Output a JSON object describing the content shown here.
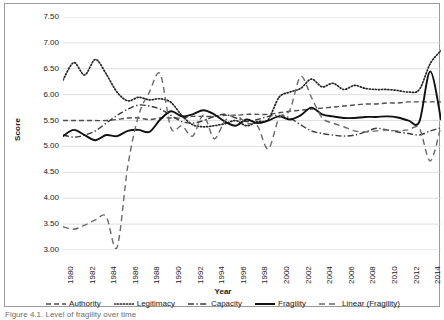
{
  "figure": {
    "caption": "Figure 4.1. Level of fragility over time"
  },
  "chart_data": {
    "type": "line",
    "title": "",
    "xlabel": "Year",
    "ylabel": "Score",
    "xlim": [
      1980,
      2015
    ],
    "ylim": [
      3.0,
      7.5
    ],
    "ytick_step": 0.5,
    "grid": true,
    "grid_axis": "y",
    "legend_position": "bottom",
    "x_tick_labels": [
      "1980",
      "1982",
      "1984",
      "1986",
      "1988",
      "1990",
      "1992",
      "1994",
      "1996",
      "1998",
      "2000",
      "2002",
      "2004",
      "2006",
      "2008",
      "2010",
      "2012",
      "2014"
    ],
    "y_tick_labels": [
      "7.50",
      "7.00",
      "6.50",
      "6.00",
      "5.50",
      "5.00",
      "4.50",
      "4.00",
      "3.50",
      "3.00"
    ],
    "x": [
      1980,
      1981,
      1982,
      1983,
      1984,
      1985,
      1986,
      1987,
      1988,
      1989,
      1990,
      1991,
      1992,
      1993,
      1994,
      1995,
      1996,
      1997,
      1998,
      1999,
      2000,
      2001,
      2002,
      2003,
      2004,
      2005,
      2006,
      2007,
      2008,
      2009,
      2010,
      2011,
      2012,
      2013,
      2014,
      2015
    ],
    "series": [
      {
        "name": "Authority",
        "style": "dashed",
        "color": "#4d4d4d",
        "values": [
          5.5,
          5.5,
          5.5,
          5.5,
          5.5,
          5.52,
          5.55,
          5.55,
          5.52,
          5.55,
          5.55,
          5.55,
          5.58,
          5.58,
          5.58,
          5.6,
          5.6,
          5.62,
          5.62,
          5.62,
          5.65,
          5.68,
          5.7,
          5.72,
          5.74,
          5.76,
          5.78,
          5.8,
          5.82,
          5.82,
          5.84,
          5.84,
          5.86,
          5.86,
          5.86,
          5.86
        ]
      },
      {
        "name": "Legitimacy",
        "style": "dotted",
        "color": "#262626",
        "values": [
          6.28,
          6.62,
          6.38,
          6.68,
          6.4,
          6.05,
          5.88,
          5.95,
          5.9,
          5.92,
          5.85,
          5.6,
          5.42,
          5.38,
          5.4,
          5.44,
          5.5,
          5.4,
          5.48,
          5.52,
          5.95,
          6.05,
          6.12,
          6.3,
          6.15,
          6.22,
          6.1,
          6.18,
          6.12,
          6.1,
          6.1,
          6.08,
          6.05,
          6.1,
          6.6,
          6.85
        ]
      },
      {
        "name": "Capacity",
        "style": "dashdot",
        "color": "#3a3a3a",
        "values": [
          5.22,
          5.18,
          5.22,
          5.3,
          5.45,
          5.6,
          5.72,
          5.8,
          5.78,
          5.72,
          5.6,
          5.48,
          5.45,
          5.5,
          5.58,
          5.62,
          5.55,
          5.48,
          5.52,
          5.58,
          5.6,
          5.55,
          5.42,
          5.3,
          5.25,
          5.22,
          5.2,
          5.22,
          5.28,
          5.35,
          5.32,
          5.28,
          5.25,
          5.22,
          5.3,
          5.36
        ]
      },
      {
        "name": "Fragility",
        "style": "solid",
        "color": "#111111",
        "values": [
          5.2,
          5.32,
          5.22,
          5.12,
          5.22,
          5.2,
          5.3,
          5.32,
          5.28,
          5.52,
          5.68,
          5.58,
          5.62,
          5.7,
          5.62,
          5.48,
          5.4,
          5.52,
          5.45,
          5.5,
          5.58,
          5.52,
          5.6,
          5.75,
          5.62,
          5.58,
          5.55,
          5.55,
          5.57,
          5.57,
          5.58,
          5.56,
          5.5,
          5.48,
          6.45,
          5.52
        ]
      },
      {
        "name": "Linear (Fragility)",
        "style": "dashed-long",
        "color": "#6a6a6a",
        "values": [
          3.45,
          3.4,
          3.48,
          3.58,
          3.65,
          3.05,
          4.62,
          5.6,
          6.05,
          6.4,
          5.35,
          5.4,
          5.2,
          5.6,
          5.15,
          5.5,
          5.6,
          5.45,
          5.4,
          4.95,
          5.55,
          5.7,
          6.35,
          5.95,
          5.55,
          5.45,
          5.38,
          5.3,
          5.28,
          5.3,
          5.32,
          5.3,
          5.32,
          5.35,
          4.72,
          5.4
        ]
      }
    ]
  },
  "legend": {
    "items": [
      {
        "label": "Authority",
        "icon": "dashed-line-icon"
      },
      {
        "label": "Legitimacy",
        "icon": "dotted-line-icon"
      },
      {
        "label": "Capacity",
        "icon": "dashdot-line-icon"
      },
      {
        "label": "Fragility",
        "icon": "solid-line-icon"
      },
      {
        "label": "Linear (Fragility)",
        "icon": "dashed-long-line-icon"
      }
    ]
  }
}
